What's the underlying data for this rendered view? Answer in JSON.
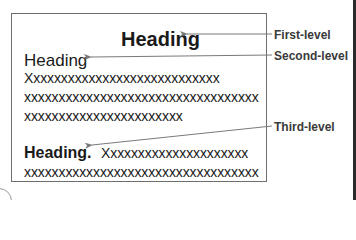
{
  "diagram": {
    "headings": {
      "first_level": "Heading",
      "second_level": "Heading",
      "third_level": "Heading."
    },
    "body_lines": [
      "Xxxxxxxxxxxxxxxxxxxxxxxxxxxx",
      "xxxxxxxxxxxxxxxxxxxxxxxxxxxxxxxxxx",
      "xxxxxxxxxxxxxxxxxxxxxxx"
    ],
    "third_level_run_in": "Xxxxxxxxxxxxxxxxxxxxx",
    "third_level_line2": "xxxxxxxxxxxxxxxxxxxxxxxxxxxxxxxxxx",
    "labels": {
      "first": "First-level",
      "second": "Second-level",
      "third": "Third-level"
    },
    "colors": {
      "text": "#1a1a1a",
      "label": "#3a3a3a",
      "leader": "#7a7a7a",
      "box_border": "#6e6e6e"
    }
  }
}
